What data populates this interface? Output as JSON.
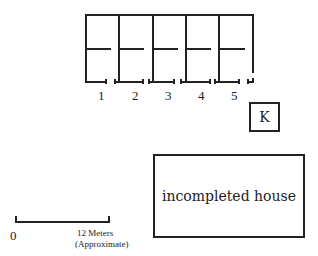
{
  "diagram": {
    "units": [
      {
        "label": "1"
      },
      {
        "label": "2"
      },
      {
        "label": "3"
      },
      {
        "label": "4"
      },
      {
        "label": "5"
      }
    ],
    "kitchen": {
      "label": "K"
    },
    "house": {
      "label": "incompleted house"
    },
    "scale": {
      "start_label": "0",
      "end_label": "12 Meters",
      "note": "(Approximate)"
    },
    "colors": {
      "line": "#222222",
      "background": "#ffffff"
    }
  }
}
